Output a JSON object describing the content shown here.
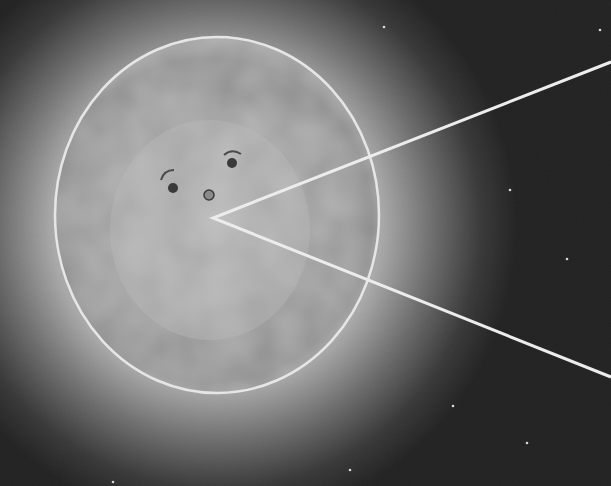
{
  "image": {
    "width": 611,
    "height": 486,
    "description": "Grayscale glowing sphere with a simple face and a wedge-shaped mouth opening to the right",
    "colors": {
      "background": "#1c1c1c",
      "glow": "#9a9a9a",
      "sphere_fill": "#9e9e9e",
      "outline": "#e6e6e6",
      "feature_dark": "#3a3a3a",
      "star": "#d8d8d8"
    }
  },
  "sphere": {
    "cx": 217,
    "cy": 215,
    "rx": 162,
    "ry": 178
  },
  "face": {
    "left_eye": {
      "cx": 173,
      "cy": 188,
      "r": 5
    },
    "right_eye": {
      "cx": 232,
      "cy": 163,
      "r": 5
    },
    "nose": {
      "cx": 209,
      "cy": 195,
      "r": 5
    },
    "left_brow": "M161 180 Q164 170 174 170",
    "right_brow": "M224 155 Q232 148 241 154"
  },
  "mouth_wedge": {
    "vertex": [
      213,
      218
    ],
    "upper_end": [
      611,
      62
    ],
    "lower_end": [
      611,
      377
    ]
  },
  "stars": [
    [
      384,
      27
    ],
    [
      510,
      190
    ],
    [
      567,
      259
    ],
    [
      453,
      406
    ],
    [
      527,
      443
    ],
    [
      113,
      482
    ],
    [
      600,
      30
    ],
    [
      350,
      470
    ]
  ]
}
